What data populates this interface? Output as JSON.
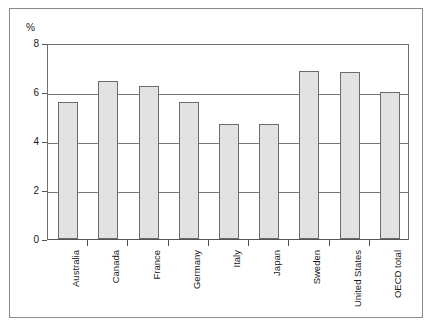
{
  "chart_data": {
    "type": "bar",
    "title": "",
    "subtitle": "",
    "xlabel": "",
    "ylabel": "%",
    "ylim": [
      0,
      8
    ],
    "yticks": [
      0,
      2,
      4,
      6,
      8
    ],
    "ytick_labels": [
      "0",
      "2",
      "4",
      "6",
      "8"
    ],
    "grid": true,
    "legend": false,
    "categories": [
      "Australia",
      "Canada",
      "France",
      "Germany",
      "Italy",
      "Japan",
      "Sweden",
      "United States",
      "OECD total"
    ],
    "values": [
      5.6,
      6.45,
      6.25,
      5.6,
      4.7,
      4.7,
      6.85,
      6.8,
      6.0
    ],
    "bar_color": "#e2e2e2",
    "bar_edge_color": "#6b6b6b",
    "grid_color": "#777777",
    "axis_color": "#555555",
    "frame_color": "#8a8a8a",
    "text_color": "#1a1a1a"
  }
}
